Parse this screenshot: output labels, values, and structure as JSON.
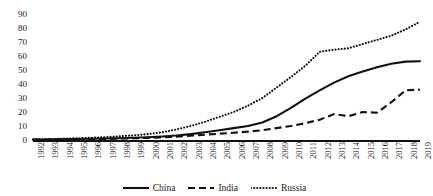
{
  "chart_data": {
    "type": "line",
    "title": "",
    "xlabel": "",
    "ylabel": "",
    "ylim": [
      0,
      90
    ],
    "y_ticks": [
      0,
      10,
      20,
      30,
      40,
      50,
      60,
      70,
      80,
      90
    ],
    "grid": false,
    "legend_position": "bottom",
    "x": [
      1992,
      1993,
      1994,
      1995,
      1996,
      1997,
      1998,
      1999,
      2000,
      2001,
      2002,
      2003,
      2004,
      2005,
      2006,
      2007,
      2008,
      2009,
      2010,
      2011,
      2012,
      2013,
      2014,
      2015,
      2016,
      2017,
      2018,
      2019
    ],
    "series": [
      {
        "name": "China",
        "style": "solid",
        "color": "#111111",
        "values": [
          0.3,
          0.4,
          0.5,
          0.7,
          0.9,
          1.1,
          1.3,
          1.6,
          2.0,
          2.5,
          3.2,
          4.2,
          5.5,
          7.0,
          8.5,
          10.0,
          12.5,
          17.0,
          23.0,
          29.5,
          35.5,
          41.0,
          45.5,
          49.0,
          52.0,
          54.5,
          56.0,
          56.2
        ]
      },
      {
        "name": "India",
        "style": "dashed",
        "color": "#111111",
        "values": [
          0.2,
          0.3,
          0.4,
          0.5,
          0.6,
          0.8,
          1.0,
          1.2,
          1.5,
          1.9,
          2.4,
          3.0,
          3.8,
          4.5,
          5.2,
          6.0,
          7.0,
          8.5,
          10.0,
          12.0,
          14.5,
          18.5,
          17.0,
          20.0,
          19.5,
          27.0,
          35.5,
          36.0
        ]
      },
      {
        "name": "Russia",
        "style": "dotted",
        "color": "#111111",
        "values": [
          0.4,
          0.6,
          0.9,
          1.2,
          1.6,
          2.0,
          2.6,
          3.3,
          4.2,
          5.5,
          7.5,
          10.0,
          13.0,
          16.5,
          20.0,
          24.5,
          30.0,
          37.5,
          45.0,
          53.0,
          63.0,
          64.5,
          65.5,
          68.5,
          71.5,
          74.5,
          79.0,
          84.5
        ]
      }
    ]
  },
  "legend": {
    "items": [
      {
        "label": "China",
        "style": "solid"
      },
      {
        "label": "India",
        "style": "dashed"
      },
      {
        "label": "Russia",
        "style": "dotted"
      }
    ]
  }
}
